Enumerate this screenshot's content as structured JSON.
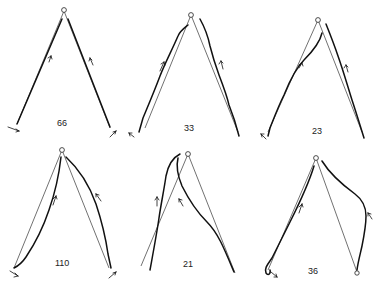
{
  "figure": {
    "panel_count": 6,
    "layout": "2 rows x 3 columns",
    "caption_visible_text": "",
    "panels": [
      {
        "id": "p1",
        "label": "66",
        "row": 0,
        "col": 0
      },
      {
        "id": "p2",
        "label": "33",
        "row": 0,
        "col": 1
      },
      {
        "id": "p3",
        "label": "23",
        "row": 0,
        "col": 2
      },
      {
        "id": "p4",
        "label": "110",
        "row": 1,
        "col": 0
      },
      {
        "id": "p5",
        "label": "21",
        "row": 1,
        "col": 1
      },
      {
        "id": "p6",
        "label": "36",
        "row": 1,
        "col": 2
      }
    ],
    "colors": {
      "ink": "#111111",
      "background": "#ffffff"
    }
  }
}
